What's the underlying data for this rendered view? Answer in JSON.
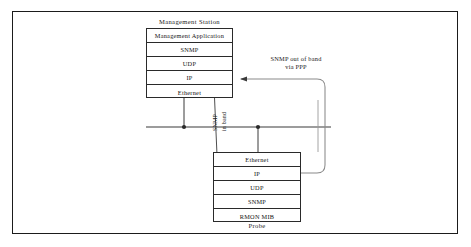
{
  "diagram": {
    "title_nodes": {
      "management_station": "Management  Station",
      "probe": "Probe"
    },
    "management_station_stack": [
      "Management Application",
      "SNMP",
      "UDP",
      "IP",
      "Ethernet"
    ],
    "probe_stack": [
      "Ethernet",
      "IP",
      "UDP",
      "SNMP",
      "RMON MIB"
    ],
    "labels": {
      "out_of_band_line1": "SNMP out of band",
      "out_of_band_line2": "via PPP",
      "in_band_word1": "SNMP",
      "in_band_word2": "in band"
    },
    "colors": {
      "frame": "#1b1b1b",
      "line": "#3a3a3a",
      "box_border": "#2a2a2a",
      "text": "#141414",
      "background": "#ffffff"
    }
  }
}
